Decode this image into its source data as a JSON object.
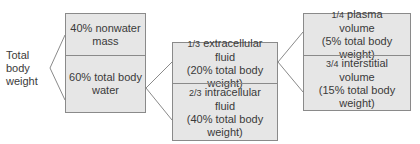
{
  "root": {
    "lines": [
      "Total",
      "body",
      "weight"
    ]
  },
  "level1": {
    "top": {
      "lines": [
        "40% nonwater",
        "mass"
      ]
    },
    "bottom": {
      "lines": [
        "60% total body",
        "water"
      ]
    }
  },
  "level2": {
    "top": {
      "fraction": "1/3",
      "lines": [
        "extracellular",
        "fluid",
        "(20% total body weight)"
      ]
    },
    "bottom": {
      "fraction": "2/3",
      "lines": [
        "intracellular",
        "fluid",
        "(40% total body weight)"
      ]
    }
  },
  "level3": {
    "top": {
      "fraction": "1/4",
      "lines": [
        "plasma",
        "volume",
        "(5% total body weight)"
      ]
    },
    "bottom": {
      "fraction": "3/4",
      "lines": [
        "interstitial",
        "volume",
        "(15% total body weight)"
      ]
    }
  },
  "colors": {
    "box_fill": "#e6e6e6",
    "border": "#8a8a8a",
    "text": "#3a3a3a"
  }
}
